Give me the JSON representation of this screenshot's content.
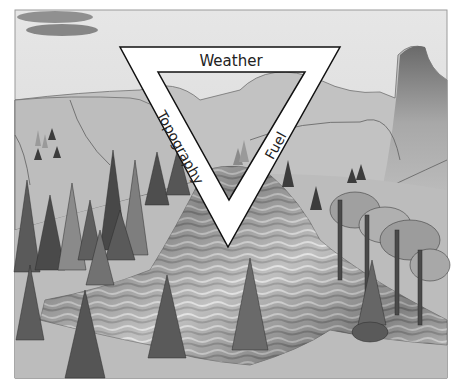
{
  "diagram": {
    "labels": {
      "top": "Weather",
      "left": "Topography",
      "right": "Fuel"
    },
    "colors": {
      "sky": "#dcdcdc",
      "hill_far": "#b8b8b8",
      "hill_near": "#c4c4c4",
      "ground": "#bdbdbd",
      "tree_dark": "#4a4a4a",
      "tree_mid": "#6e6e6e",
      "tree_light": "#8c8c8c",
      "fire": "#8a8a8a",
      "triangle_fill": "#ffffff",
      "triangle_stroke": "#111111",
      "frame": "#9a9a9a"
    }
  }
}
